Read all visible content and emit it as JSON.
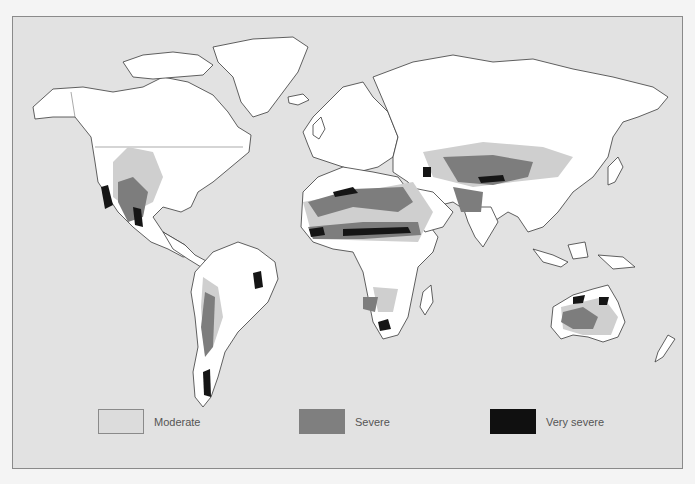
{
  "map": {
    "type": "world choropleth",
    "subject": "desertification / drought severity regions",
    "background_color": "#e2e2e2",
    "land_color": "#ffffff"
  },
  "legend": {
    "items": [
      {
        "key": "moderate",
        "label": "Moderate",
        "color": "#dcdcdc"
      },
      {
        "key": "severe",
        "label": "Severe",
        "color": "#7f7f7f"
      },
      {
        "key": "very_severe",
        "label": "Very severe",
        "color": "#101010"
      }
    ]
  }
}
